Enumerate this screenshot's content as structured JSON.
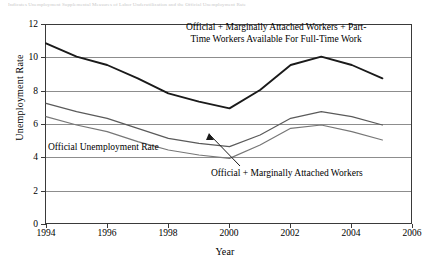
{
  "cut_caption": "Indicates  Unemployment  Supplemental  Measures  of  Labor  Underutilization  and  the  Official  Unemployment  Rate",
  "axes": {
    "ylabel": "Unemployment Rate",
    "xlabel": "Year",
    "yticks": [
      "0",
      "2",
      "4",
      "6",
      "8",
      "10",
      "12"
    ],
    "xticks": [
      "1994",
      "1996",
      "1998",
      "2000",
      "2002",
      "2004",
      "2006"
    ]
  },
  "annotations": {
    "top_line1": "Official + Marginally Attached Workers +  Part-",
    "top_line2": "Time Workers Available For Full-Time Work",
    "official": "Official Unemployment Rate",
    "marginal": "Official + Marginally Attached Workers"
  },
  "colors": {
    "line_top": "#1a1a1a",
    "line_mid": "#5a5a5a",
    "line_bottom": "#777777",
    "grid": "#8d8d8d",
    "frame": "#3a3a3a"
  },
  "chart_data": {
    "type": "line",
    "title": "",
    "xlabel": "Year",
    "ylabel": "Unemployment Rate",
    "xlim": [
      1994,
      2006
    ],
    "ylim": [
      0,
      12
    ],
    "grid": true,
    "legend": "annotations-inline",
    "x": [
      1994,
      1995,
      1996,
      1997,
      1998,
      1999,
      2000,
      2001,
      2002,
      2003,
      2004,
      2005
    ],
    "series": [
      {
        "name": "Official + Marginally Attached Workers + Part-Time Workers Available For Full-Time Work",
        "values": [
          10.9,
          10.1,
          9.6,
          8.8,
          7.9,
          7.4,
          7.0,
          8.1,
          9.6,
          10.1,
          9.6,
          8.8
        ]
      },
      {
        "name": "Official + Marginally Attached Workers",
        "values": [
          7.3,
          6.8,
          6.4,
          5.8,
          5.2,
          4.9,
          4.7,
          5.4,
          6.4,
          6.8,
          6.5,
          6.0
        ]
      },
      {
        "name": "Official Unemployment Rate",
        "values": [
          6.5,
          6.0,
          5.6,
          5.0,
          4.5,
          4.2,
          4.0,
          4.8,
          5.8,
          6.0,
          5.6,
          5.1
        ]
      }
    ]
  }
}
